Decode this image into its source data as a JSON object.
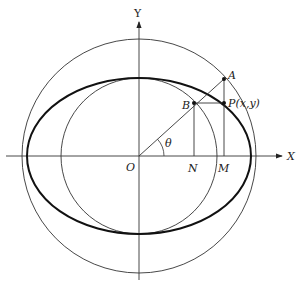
{
  "diagram": {
    "axes": {
      "x_label": "X",
      "y_label": "Y",
      "origin_label": "O"
    },
    "points": {
      "A": "A",
      "B": "B",
      "P": "P(x,y)",
      "N": "N",
      "M": "M"
    },
    "angle_label": "θ",
    "shapes": [
      "outer-circle (radius a)",
      "ellipse (semi-axes a, b)",
      "inner-circle (radius b)"
    ],
    "colors": {
      "stroke": "#222222",
      "background": "#ffffff"
    }
  }
}
